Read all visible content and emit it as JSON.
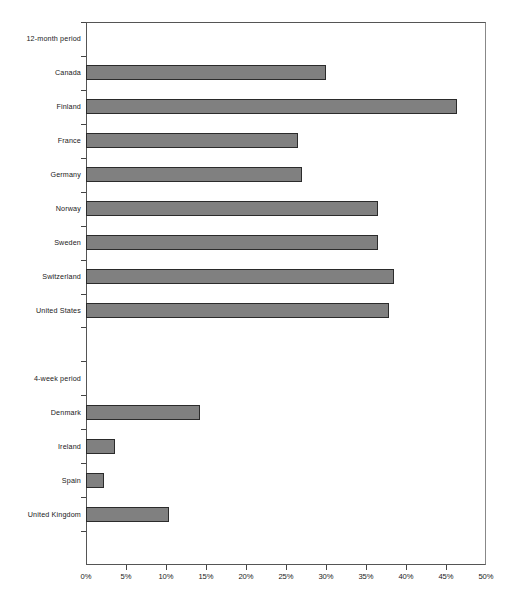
{
  "chart_data": {
    "type": "bar",
    "orientation": "horizontal",
    "title": "",
    "xlabel": "",
    "ylabel": "",
    "xlim": [
      0,
      50
    ],
    "xtick_labels": [
      "0%",
      "5%",
      "10%",
      "15%",
      "20%",
      "25%",
      "30%",
      "35%",
      "40%",
      "45%",
      "50%"
    ],
    "xticks": [
      0,
      5,
      10,
      15,
      20,
      25,
      30,
      35,
      40,
      45,
      50
    ],
    "grid": false,
    "legend": null,
    "bar_color": "#808080",
    "bar_edge_color": "#2b2b2b",
    "groups": [
      {
        "header": "12-month period",
        "categories": [
          "Canada",
          "Finland",
          "France",
          "Germany",
          "Norway",
          "Sweden",
          "Switzerland",
          "United States"
        ],
        "values": [
          30.0,
          46.4,
          26.5,
          27.0,
          36.5,
          36.5,
          38.5,
          37.9
        ]
      },
      {
        "header": "4-week period",
        "categories": [
          "Denmark",
          "Ireland",
          "Spain",
          "United Kingdom"
        ],
        "values": [
          14.2,
          3.6,
          2.2,
          10.4
        ]
      }
    ],
    "rows": [
      {
        "label": "12-month period",
        "value": null,
        "kind": "header"
      },
      {
        "label": "Canada",
        "value": 30.0,
        "kind": "bar"
      },
      {
        "label": "Finland",
        "value": 46.4,
        "kind": "bar"
      },
      {
        "label": "France",
        "value": 26.5,
        "kind": "bar"
      },
      {
        "label": "Germany",
        "value": 27.0,
        "kind": "bar"
      },
      {
        "label": "Norway",
        "value": 36.5,
        "kind": "bar"
      },
      {
        "label": "Sweden",
        "value": 36.5,
        "kind": "bar"
      },
      {
        "label": "Switzerland",
        "value": 38.5,
        "kind": "bar"
      },
      {
        "label": "United States",
        "value": 37.9,
        "kind": "bar"
      },
      {
        "label": "",
        "value": null,
        "kind": "spacer"
      },
      {
        "label": "4-week period",
        "value": null,
        "kind": "header"
      },
      {
        "label": "Denmark",
        "value": 14.2,
        "kind": "bar"
      },
      {
        "label": "Ireland",
        "value": 3.6,
        "kind": "bar"
      },
      {
        "label": "Spain",
        "value": 2.2,
        "kind": "bar"
      },
      {
        "label": "United Kingdom",
        "value": 10.4,
        "kind": "bar"
      },
      {
        "label": "",
        "value": null,
        "kind": "spacer"
      }
    ]
  }
}
